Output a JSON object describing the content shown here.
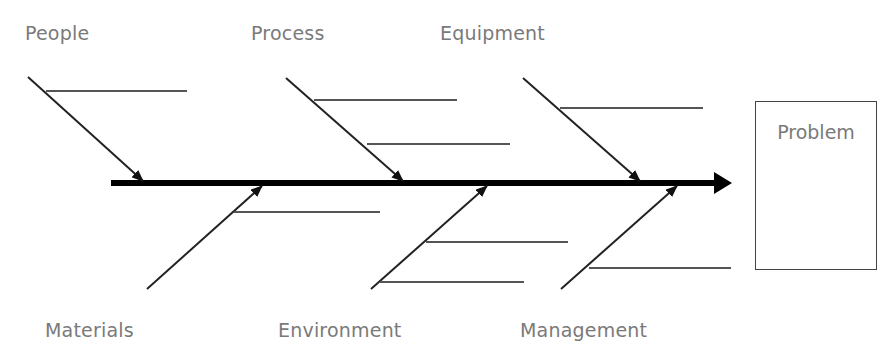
{
  "diagram": {
    "type": "fishbone",
    "title": "",
    "effect": {
      "label": "Problem"
    },
    "causes_top": [
      {
        "label": "People",
        "sub_lines": 1
      },
      {
        "label": "Process",
        "sub_lines": 2
      },
      {
        "label": "Equipment",
        "sub_lines": 1
      }
    ],
    "causes_bottom": [
      {
        "label": "Materials",
        "sub_lines": 1
      },
      {
        "label": "Environment",
        "sub_lines": 2
      },
      {
        "label": "Management",
        "sub_lines": 1
      }
    ],
    "colors": {
      "spine": "#000000",
      "bones": "#222222",
      "sub_lines": "#555555",
      "label_text": "#7a7a7a",
      "box_border": "#444444"
    }
  }
}
